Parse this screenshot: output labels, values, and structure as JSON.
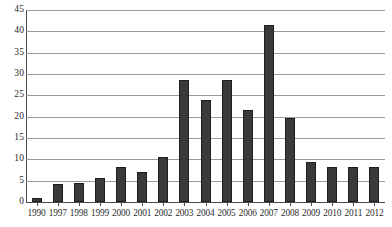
{
  "chart_data": {
    "type": "bar",
    "title": "",
    "xlabel": "",
    "ylabel": "",
    "ylim": [
      0,
      45
    ],
    "ytick_step": 5,
    "grid": true,
    "legend": "none",
    "bar_color": "#3a3a3a",
    "gridline_color": "#9a9a9a",
    "axis_color": "#4a4a4a",
    "yticks": [
      "45",
      "40",
      "35",
      "30",
      "25",
      "20",
      "15",
      "10",
      "5",
      "0"
    ],
    "categories": [
      "1990",
      "1997",
      "1998",
      "1999",
      "2000",
      "2001",
      "2002",
      "2003",
      "2004",
      "2005",
      "2006",
      "2007",
      "2008",
      "2009",
      "2010",
      "2011",
      "2012"
    ],
    "values": [
      1.0,
      4.3,
      4.4,
      5.7,
      8.3,
      7.0,
      10.5,
      28.7,
      23.8,
      28.7,
      21.6,
      41.5,
      19.8,
      9.4,
      8.3,
      8.3,
      8.3
    ]
  }
}
